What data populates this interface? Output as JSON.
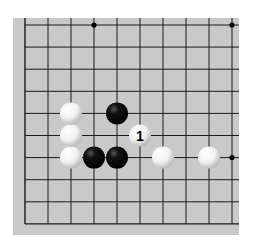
{
  "diagram": {
    "type": "go-board-fragment",
    "board_color": "#c9c9c9",
    "line_color": "#1a1a1a",
    "columns": 10,
    "rows": 10,
    "open_edges": [
      "top",
      "right"
    ],
    "star_points": [
      {
        "col": 3,
        "row": 0
      },
      {
        "col": 9,
        "row": 0
      },
      {
        "col": 9,
        "row": 6
      }
    ],
    "stones": [
      {
        "color": "white",
        "col": 2,
        "row": 4
      },
      {
        "color": "black",
        "col": 4,
        "row": 4
      },
      {
        "color": "white",
        "col": 2,
        "row": 5
      },
      {
        "color": "white",
        "col": 5,
        "row": 5,
        "label": "1"
      },
      {
        "color": "white",
        "col": 2,
        "row": 6
      },
      {
        "color": "black",
        "col": 3,
        "row": 6
      },
      {
        "color": "black",
        "col": 4,
        "row": 6
      },
      {
        "color": "white",
        "col": 6,
        "row": 6
      },
      {
        "color": "white",
        "col": 8,
        "row": 6
      }
    ]
  }
}
